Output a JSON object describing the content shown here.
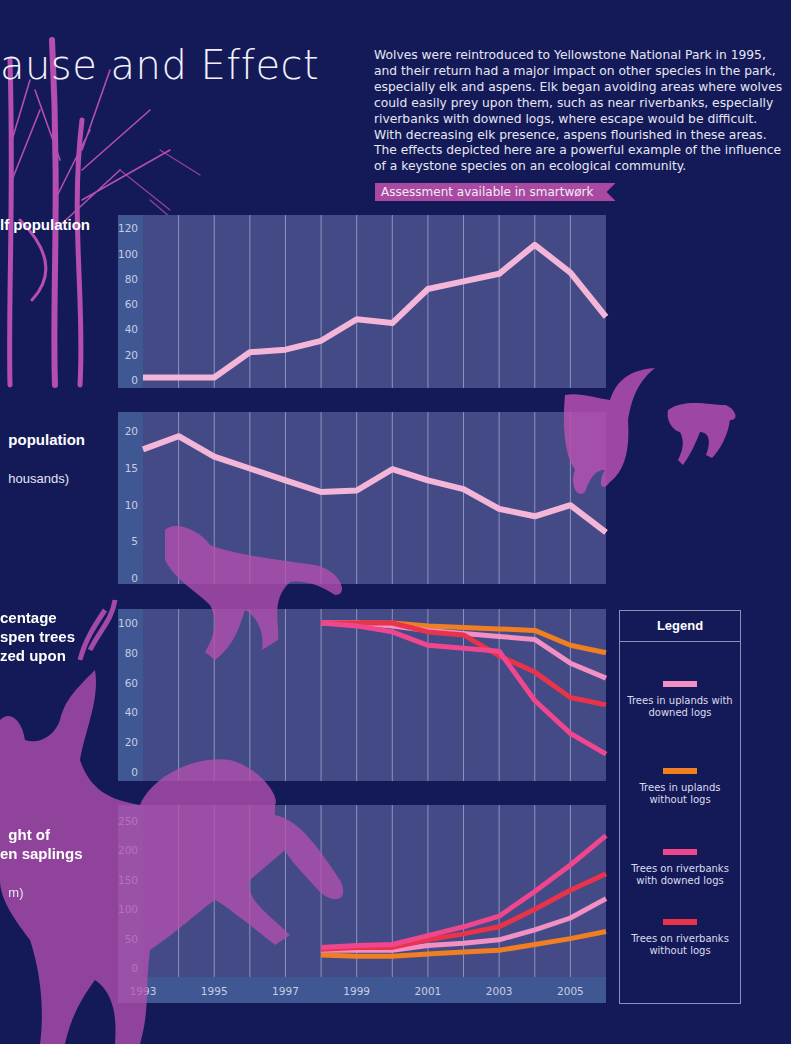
{
  "header": {
    "title": "ause and Effect",
    "intro": "Wolves were reintroduced to Yellowstone National Park in 1995, and their return had a major impact on other species in the park, especially elk and aspens. Elk began avoiding areas where wolves could easily prey upon them, such as near riverbanks, especially riverbanks with downed logs, where escape would be difficult. With decreasing elk presence, aspens flourished in these areas. The effects depicted here are a powerful example of the influence of a keystone species on an ecological community.",
    "assessment_banner": "Assessment available in smartwørk"
  },
  "panel_labels": {
    "wolf": "lf population",
    "elk": "population",
    "elk_sub": "housands)",
    "grazed": "centage\nspen trees\nzed upon",
    "height": "ght of\nen saplings",
    "height_sub": "m)"
  },
  "legend": {
    "title": "Legend",
    "items": [
      {
        "label": "Trees in uplands with downed logs",
        "color": "#f28fc3"
      },
      {
        "label": "Trees in uplands without logs",
        "color": "#ef7f22"
      },
      {
        "label": "Trees on riverbanks with downed logs",
        "color": "#f0468e"
      },
      {
        "label": "Trees on riverbanks without logs",
        "color": "#e8334a"
      }
    ]
  },
  "colors": {
    "background": "#141a58",
    "panel": "#434a85",
    "axis_band": "#3f5793",
    "silhouette": "#a64ca8",
    "wolf_elk_line": "#f4b6d8"
  },
  "chart_data": [
    {
      "type": "line",
      "title": "Wolf population",
      "xlabel": "",
      "ylabel": "",
      "x": [
        1993,
        1994,
        1995,
        1996,
        1997,
        1998,
        1999,
        2000,
        2001,
        2002,
        2003,
        2004,
        2005,
        2006
      ],
      "series": [
        {
          "name": "Wolf population",
          "values": [
            2,
            2,
            2,
            22,
            24,
            31,
            48,
            45,
            72,
            78,
            84,
            107,
            85,
            50
          ]
        }
      ],
      "yticks": [
        0,
        20,
        40,
        60,
        80,
        100,
        120
      ],
      "ylim": [
        0,
        125
      ]
    },
    {
      "type": "line",
      "title": "Elk population (thousands)",
      "x": [
        1993,
        1994,
        1995,
        1996,
        1997,
        1998,
        1999,
        2000,
        2001,
        2002,
        2003,
        2004,
        2005,
        2006
      ],
      "series": [
        {
          "name": "Elk population",
          "values": [
            17.5,
            19.3,
            16.5,
            14.9,
            13.3,
            11.7,
            11.9,
            14.8,
            13.3,
            12.1,
            9.4,
            8.4,
            9.9,
            6.2
          ]
        }
      ],
      "yticks": [
        0,
        5,
        10,
        15,
        20
      ],
      "ylim": [
        0,
        21.5
      ]
    },
    {
      "type": "line",
      "title": "Percentage of aspen trees grazed upon",
      "x": [
        1998,
        1999,
        2000,
        2001,
        2002,
        2003,
        2004,
        2005,
        2006
      ],
      "series": [
        {
          "name": "Trees in uplands with downed logs",
          "values": [
            100,
            100,
            98,
            95,
            93,
            91,
            89,
            73,
            63
          ]
        },
        {
          "name": "Trees in uplands without logs",
          "values": [
            100,
            100,
            100,
            98,
            97,
            96,
            95,
            85,
            80
          ]
        },
        {
          "name": "Trees on riverbanks with downed logs",
          "values": [
            100,
            98,
            94,
            85,
            83,
            81,
            48,
            26,
            12
          ]
        },
        {
          "name": "Trees on riverbanks without logs",
          "values": [
            100,
            100,
            100,
            94,
            92,
            78,
            67,
            50,
            45
          ]
        }
      ],
      "yticks": [
        0,
        20,
        40,
        60,
        80,
        100
      ],
      "ylim": [
        0,
        104
      ]
    },
    {
      "type": "line",
      "title": "Height of aspen saplings (cm)",
      "x": [
        1998,
        1999,
        2000,
        2001,
        2002,
        2003,
        2004,
        2005,
        2006
      ],
      "series": [
        {
          "name": "Trees in uplands with downed logs",
          "values": [
            30,
            30,
            30,
            38,
            42,
            48,
            65,
            85,
            118
          ]
        },
        {
          "name": "Trees in uplands without logs",
          "values": [
            22,
            20,
            20,
            24,
            27,
            30,
            40,
            50,
            62
          ]
        },
        {
          "name": "Trees on riverbanks with downed logs",
          "values": [
            35,
            38,
            40,
            55,
            70,
            88,
            130,
            175,
            225
          ]
        },
        {
          "name": "Trees on riverbanks without logs",
          "values": [
            32,
            35,
            35,
            48,
            58,
            70,
            100,
            132,
            160
          ]
        }
      ],
      "yticks": [
        0,
        50,
        100,
        150,
        200,
        250
      ],
      "ylim": [
        0,
        260
      ]
    }
  ],
  "x_axis": {
    "labels": [
      "1993",
      "1995",
      "1997",
      "1999",
      "2001",
      "2003",
      "2005"
    ]
  }
}
